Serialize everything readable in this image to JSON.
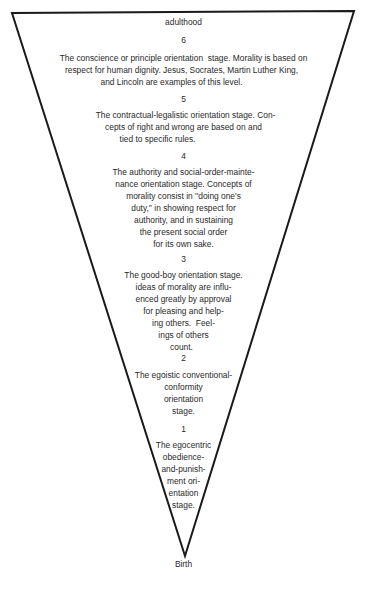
{
  "diagram": {
    "top_label": "adulthood",
    "bottom_label": "Birth",
    "stages": [
      {
        "number": "6",
        "lines": [
          "The conscience or principle orientation  stage. Morality is based on",
          "respect for human dignity. Jesus, Socrates, Martin Luther King,",
          "and Lincoln are examples of this level."
        ]
      },
      {
        "number": "5",
        "lines": [
          "The contractual-legalistic orientation stage. Con-",
          "cepts of right and wrong are based on and",
          "tied to specific rules."
        ]
      },
      {
        "number": "4",
        "lines": [
          "The authority and social-order-mainte-",
          "nance orientation stage. Concepts of",
          "morality consist in ''doing one's",
          "duty,'' in showing respect for",
          "authority, and in sustaining",
          "the present social order",
          "for its own sake."
        ]
      },
      {
        "number": "3",
        "lines": [
          "The good-boy orientation stage.",
          "ideas of morality are influ-",
          "enced greatly by approval",
          "for pleasing and help-",
          "ing others.  Feel-",
          "ings of others",
          "count."
        ]
      },
      {
        "number": "2",
        "lines": [
          "The egoistic conventional-",
          "conformity",
          "orientation",
          "stage."
        ]
      },
      {
        "number": "1",
        "lines": [
          "The egocentric",
          "obedience-",
          "and-punish-",
          "ment ori-",
          "entation",
          "stage."
        ]
      }
    ]
  }
}
